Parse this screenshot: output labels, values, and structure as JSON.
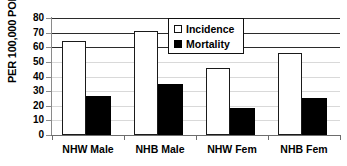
{
  "chart_data": {
    "type": "bar",
    "title": "",
    "xlabel": "",
    "ylabel": "PER 100,000 POP.",
    "ylim": [
      0,
      80
    ],
    "yticks": [
      0,
      10,
      20,
      30,
      40,
      50,
      60,
      70,
      80
    ],
    "ytick_labels": [
      "0",
      "10",
      "20",
      "30",
      "40",
      "50",
      "60",
      "70",
      "80"
    ],
    "grid": true,
    "grid_axis": "y",
    "legend_position": "upper-center",
    "categories": [
      "NHW Male",
      "NHB Male",
      "NHW Fem",
      "NHB Fem"
    ],
    "series": [
      {
        "name": "Incidence",
        "swatch": "open-square",
        "color": "#ffffff",
        "edge_color": "#000000",
        "values": [
          64.5,
          71.0,
          46.0,
          56.0
        ]
      },
      {
        "name": "Mortality",
        "swatch": "filled-square",
        "color": "#000000",
        "edge_color": "#000000",
        "values": [
          26.8,
          35.0,
          18.5,
          25.5
        ]
      }
    ]
  },
  "axis": {
    "y_title": "PER 100,000 POP."
  },
  "legend": {
    "entries": [
      {
        "label": "Incidence"
      },
      {
        "label": "Mortality"
      }
    ]
  }
}
